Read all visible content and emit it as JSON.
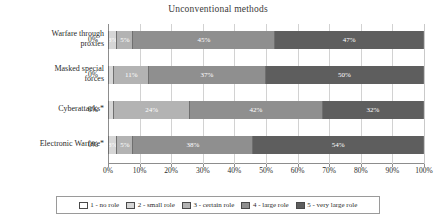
{
  "chart_data": {
    "type": "bar",
    "orientation": "horizontal",
    "stacked": true,
    "normalized": true,
    "title": "Unconventional methods",
    "xlabel": "",
    "ylabel": "",
    "xlim": [
      0,
      100
    ],
    "grid": true,
    "legend_position": "bottom",
    "categories": [
      "Warfare through proxies",
      "Masked special forces",
      "Cyberattacks*",
      "Electronic Warfare*"
    ],
    "tick_labels": [
      "0%",
      "10%",
      "20%",
      "30%",
      "40%",
      "50%",
      "60%",
      "70%",
      "80%",
      "90%",
      "100%"
    ],
    "tick_values": [
      0,
      10,
      20,
      30,
      40,
      50,
      60,
      70,
      80,
      90,
      100
    ],
    "series": [
      {
        "name": "1 - no role",
        "color": "#ffffff",
        "values": [
          0,
          0,
          0,
          0
        ]
      },
      {
        "name": "2 - small role",
        "color": "#d6d6d6",
        "values": [
          3,
          2,
          2,
          3
        ]
      },
      {
        "name": "3 - certain role",
        "color": "#b3b3b3",
        "values": [
          5,
          11,
          24,
          5
        ]
      },
      {
        "name": "4 - large role",
        "color": "#8f8f8f",
        "values": [
          45,
          37,
          42,
          38
        ]
      },
      {
        "name": "5 - very large role",
        "color": "#5e5e5e",
        "values": [
          47,
          50,
          32,
          54
        ]
      }
    ],
    "bars": [
      {
        "category": "Warfare through proxies",
        "outside_label": "0%",
        "segments": [
          {
            "series": "1 - no role",
            "value": 0,
            "label": ""
          },
          {
            "series": "2 - small role",
            "value": 3,
            "label": "3%"
          },
          {
            "series": "3 - certain role",
            "value": 5,
            "label": "5%"
          },
          {
            "series": "4 - large role",
            "value": 45,
            "label": "45%"
          },
          {
            "series": "5 - very large role",
            "value": 47,
            "label": "47%"
          }
        ]
      },
      {
        "category": "Masked special forces",
        "outside_label": "0%",
        "segments": [
          {
            "series": "1 - no role",
            "value": 0,
            "label": ""
          },
          {
            "series": "2 - small role",
            "value": 2,
            "label": ""
          },
          {
            "series": "3 - certain role",
            "value": 11,
            "label": "11%"
          },
          {
            "series": "4 - large role",
            "value": 37,
            "label": "37%"
          },
          {
            "series": "5 - very large role",
            "value": 50,
            "label": "50%"
          }
        ]
      },
      {
        "category": "Cyberattacks*",
        "outside_label": "0%",
        "segments": [
          {
            "series": "1 - no role",
            "value": 0,
            "label": ""
          },
          {
            "series": "2 - small role",
            "value": 2,
            "label": ""
          },
          {
            "series": "3 - certain role",
            "value": 24,
            "label": "24%"
          },
          {
            "series": "4 - large role",
            "value": 42,
            "label": "42%"
          },
          {
            "series": "5 - very large role",
            "value": 32,
            "label": "32%"
          }
        ]
      },
      {
        "category": "Electronic Warfare*",
        "outside_label": "0%",
        "segments": [
          {
            "series": "1 - no role",
            "value": 0,
            "label": ""
          },
          {
            "series": "2 - small role",
            "value": 3,
            "label": "3%"
          },
          {
            "series": "3 - certain role",
            "value": 5,
            "label": "5%"
          },
          {
            "series": "4 - large role",
            "value": 38,
            "label": "38%"
          },
          {
            "series": "5 - very large role",
            "value": 54,
            "label": "54%"
          }
        ]
      }
    ]
  },
  "category_lines": [
    [
      "Warfare through",
      "proxies"
    ],
    [
      "Masked special",
      "forces"
    ],
    [
      "Cyberattacks*",
      ""
    ],
    [
      "Electronic Warfare*",
      ""
    ]
  ],
  "legend": {
    "items": [
      {
        "label": "1 - no role",
        "color": "#ffffff"
      },
      {
        "label": "2 - small role",
        "color": "#d6d6d6"
      },
      {
        "label": "3 - certain role",
        "color": "#b3b3b3"
      },
      {
        "label": "4 - large role",
        "color": "#8f8f8f"
      },
      {
        "label": "5 - very large role",
        "color": "#5e5e5e"
      }
    ]
  }
}
